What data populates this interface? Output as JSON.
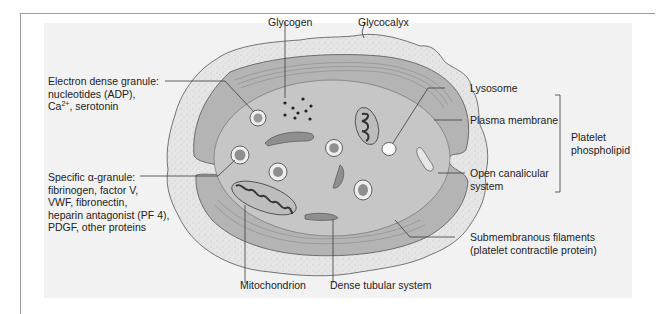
{
  "figure": {
    "colors": {
      "panel_bg": "#f2f2f2",
      "glycocalyx": "#e6e6e6",
      "membrane_zone": "#b4b4b4",
      "cytoplasm": "#c6c6c6",
      "organelle_dark": "#8f8f8f",
      "line": "#3a3a3a"
    },
    "labels": {
      "glycogen": "Glycogen",
      "glycocalyx": "Glycocalyx",
      "electron_dense_granule": {
        "line1": "Electron dense granule:",
        "line2": "nucleotides (ADP),",
        "line3_prefix": "Ca",
        "line3_sup": "2+",
        "line3_suffix": ", serotonin"
      },
      "lysosome": "Lysosome",
      "plasma_membrane": "Plasma membrane",
      "platelet_phospholipid": {
        "line1": "Platelet",
        "line2": "phospholipid"
      },
      "alpha_granule": {
        "line1": "Specific α-granule:",
        "line2": "fibrinogen, factor V,",
        "line3": "VWF, fibronectin,",
        "line4": "heparin antagonist (PF 4),",
        "line5": "PDGF, other proteins"
      },
      "open_canalicular": {
        "line1": "Open canalicular",
        "line2": "system"
      },
      "submembranous": {
        "line1": "Submembranous filaments",
        "line2": "(platelet contractile protein)"
      },
      "mitochondrion": "Mitochondrion",
      "dense_tubular": "Dense tubular system"
    }
  }
}
